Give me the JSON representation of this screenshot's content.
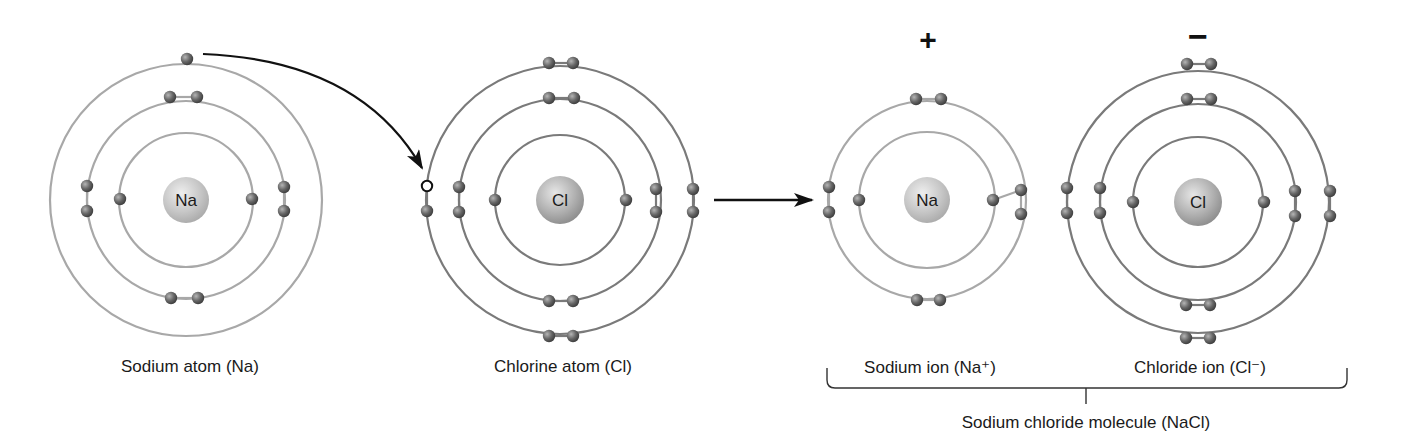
{
  "diagram": {
    "colors": {
      "ring_light": "#a8a8a8",
      "ring_dark": "#7a7a7a",
      "electron": "#5f5f5f",
      "nucleus_na": "#c9c9c9",
      "nucleus_cl": "#b3b3b3",
      "arrow": "#111111"
    },
    "atoms": [
      {
        "id": "sodium-atom",
        "symbol": "Na",
        "cx": 186,
        "cy": 200,
        "nucleus_r": 23,
        "ring_color": "ring_light",
        "rings": [
          67,
          99,
          136
        ],
        "electrons": [
          [
            120,
            199
          ],
          [
            252,
            199
          ],
          [
            170,
            97
          ],
          [
            197,
            97
          ],
          [
            87,
            186
          ],
          [
            87,
            211
          ],
          [
            284,
            187
          ],
          [
            284,
            211
          ],
          [
            171,
            298
          ],
          [
            198,
            298
          ],
          [
            187,
            59
          ]
        ],
        "label": "Sodium atom (Na)",
        "label_x": 190,
        "label_y": 357
      },
      {
        "id": "chlorine-atom",
        "symbol": "Cl",
        "cx": 560,
        "cy": 200,
        "nucleus_r": 24,
        "ring_color": "ring_dark",
        "rings": [
          65,
          101,
          134
        ],
        "electrons": [
          [
            495,
            200
          ],
          [
            626,
            200
          ],
          [
            549,
            98
          ],
          [
            574,
            98
          ],
          [
            459,
            187
          ],
          [
            459,
            212
          ],
          [
            656,
            189
          ],
          [
            656,
            212
          ],
          [
            549,
            301
          ],
          [
            573,
            301
          ],
          [
            549,
            63
          ],
          [
            573,
            63
          ],
          [
            427,
            211
          ],
          [
            693,
            189
          ],
          [
            693,
            212
          ],
          [
            549,
            336
          ],
          [
            573,
            336
          ]
        ],
        "hole": [
          427,
          186
        ],
        "label": "Chlorine atom (Cl)",
        "label_x": 563,
        "label_y": 357
      },
      {
        "id": "sodium-ion",
        "symbol": "Na",
        "cx": 927,
        "cy": 200,
        "nucleus_r": 23,
        "ring_color": "ring_light",
        "rings": [
          68,
          99
        ],
        "electrons": [
          [
            859,
            200
          ],
          [
            993,
            200
          ],
          [
            916,
            99
          ],
          [
            941,
            99
          ],
          [
            829,
            187
          ],
          [
            829,
            212
          ],
          [
            1021,
            190
          ],
          [
            1021,
            214
          ],
          [
            917,
            300
          ],
          [
            940,
            300
          ]
        ],
        "label": "Sodium ion (Na⁺)",
        "label_x": 930,
        "label_y": 357,
        "charge": "+",
        "charge_x": 928,
        "charge_y": 40
      },
      {
        "id": "chloride-ion",
        "symbol": "Cl",
        "cx": 1198,
        "cy": 202,
        "nucleus_r": 24,
        "ring_color": "ring_dark",
        "rings": [
          65,
          98,
          131
        ],
        "electrons": [
          [
            1133,
            202
          ],
          [
            1264,
            202
          ],
          [
            1187,
            99
          ],
          [
            1211,
            99
          ],
          [
            1100,
            188
          ],
          [
            1100,
            213
          ],
          [
            1295,
            191
          ],
          [
            1295,
            216
          ],
          [
            1186,
            305
          ],
          [
            1210,
            305
          ],
          [
            1187,
            64
          ],
          [
            1211,
            64
          ],
          [
            1067,
            188
          ],
          [
            1067,
            213
          ],
          [
            1330,
            191
          ],
          [
            1330,
            216
          ],
          [
            1186,
            338
          ],
          [
            1210,
            338
          ]
        ],
        "label": "Chloride ion (Cl⁻)",
        "label_x": 1200,
        "label_y": 357,
        "charge": "−",
        "charge_x": 1198,
        "charge_y": 36
      }
    ],
    "transfer_arrow": {
      "from": [
        203,
        54
      ],
      "control": [
        360,
        60
      ],
      "to": [
        422,
        168
      ]
    },
    "reaction_arrow": {
      "x1": 714,
      "x2": 812,
      "y": 200
    },
    "bracket": {
      "x1": 827,
      "x2": 1347,
      "top": 368,
      "bottom": 388,
      "tick_x": 1086,
      "tick_bottom": 404
    },
    "molecule_label": {
      "text": "Sodium chloride molecule (NaCl)",
      "x": 1086,
      "y": 413
    }
  }
}
